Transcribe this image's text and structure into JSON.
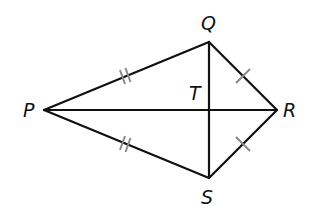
{
  "figure": {
    "type": "kite",
    "colors": {
      "line": "#111111",
      "tick": "#8a8a8a",
      "background": "#ffffff"
    },
    "vertices": [
      {
        "id": "P",
        "label": "P",
        "x": 44,
        "y": 110,
        "label_x": 23,
        "label_y": 117
      },
      {
        "id": "Q",
        "label": "Q",
        "x": 209,
        "y": 42,
        "label_x": 201,
        "label_y": 30
      },
      {
        "id": "R",
        "label": "R",
        "x": 277,
        "y": 110,
        "label_x": 283,
        "label_y": 117
      },
      {
        "id": "S",
        "label": "S",
        "x": 209,
        "y": 178,
        "label_x": 201,
        "label_y": 204
      }
    ],
    "intersection": {
      "id": "T",
      "label": "T",
      "x": 209,
      "y": 110,
      "label_x": 189,
      "label_y": 100
    },
    "segments": [
      {
        "from": "P",
        "to": "Q",
        "ticks": 2
      },
      {
        "from": "P",
        "to": "S",
        "ticks": 2
      },
      {
        "from": "Q",
        "to": "R",
        "ticks": 1
      },
      {
        "from": "S",
        "to": "R",
        "ticks": 1
      },
      {
        "from": "P",
        "to": "R",
        "ticks": 0
      },
      {
        "from": "Q",
        "to": "S",
        "ticks": 0
      }
    ],
    "congruence": [
      {
        "segments": [
          "PQ",
          "PS"
        ],
        "marks": "double tick"
      },
      {
        "segments": [
          "QR",
          "SR"
        ],
        "marks": "single tick"
      }
    ]
  }
}
